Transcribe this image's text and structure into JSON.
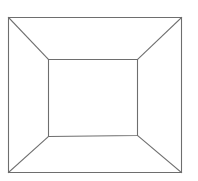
{
  "diagram": {
    "type": "square-frustum-top-view",
    "background_color": "#ffffff",
    "line_color": "#6e6e6e",
    "outer_square": {
      "top_left": [
        8,
        17
      ],
      "top_right": [
        181,
        17
      ],
      "bottom_right": [
        181,
        172
      ],
      "bottom_left": [
        8,
        172
      ]
    },
    "inner_square": {
      "top_left": [
        48,
        59
      ],
      "top_right": [
        137,
        59
      ],
      "bottom_right": [
        137,
        135
      ],
      "bottom_left": [
        48,
        136
      ]
    },
    "connectors": [
      {
        "name": "top-left",
        "from": [
          8,
          17
        ],
        "to": [
          48,
          59
        ]
      },
      {
        "name": "top-right",
        "from": [
          181,
          17
        ],
        "to": [
          137,
          59
        ]
      },
      {
        "name": "bottom-right",
        "from": [
          181,
          172
        ],
        "to": [
          137,
          135
        ]
      },
      {
        "name": "bottom-left",
        "from": [
          8,
          172
        ],
        "to": [
          48,
          136
        ]
      }
    ]
  }
}
